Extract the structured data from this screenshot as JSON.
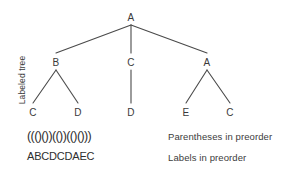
{
  "figure": {
    "side_label": "Labeled tree",
    "background_color": "#ffffff",
    "line_color": "#4a4a4a",
    "text_color": "#3a3a3a"
  },
  "tree": {
    "nodes": [
      {
        "id": "n0",
        "label": "A",
        "x": 131,
        "y": 17,
        "level": 0
      },
      {
        "id": "n1",
        "label": "B",
        "x": 56,
        "y": 62,
        "level": 1
      },
      {
        "id": "n2",
        "label": "C",
        "x": 131,
        "y": 62,
        "level": 1
      },
      {
        "id": "n3",
        "label": "A",
        "x": 207,
        "y": 62,
        "level": 1
      },
      {
        "id": "n4",
        "label": "C",
        "x": 33,
        "y": 112,
        "level": 2
      },
      {
        "id": "n5",
        "label": "D",
        "x": 78,
        "y": 112,
        "level": 2
      },
      {
        "id": "n6",
        "label": "D",
        "x": 131,
        "y": 112,
        "level": 2
      },
      {
        "id": "n7",
        "label": "E",
        "x": 186,
        "y": 112,
        "level": 2
      },
      {
        "id": "n8",
        "label": "C",
        "x": 230,
        "y": 112,
        "level": 2
      }
    ],
    "edges": [
      {
        "from": "n0",
        "to": "n1"
      },
      {
        "from": "n0",
        "to": "n2"
      },
      {
        "from": "n0",
        "to": "n3"
      },
      {
        "from": "n1",
        "to": "n4"
      },
      {
        "from": "n1",
        "to": "n5"
      },
      {
        "from": "n2",
        "to": "n6"
      },
      {
        "from": "n3",
        "to": "n7"
      },
      {
        "from": "n3",
        "to": "n8"
      }
    ]
  },
  "sequences": {
    "parentheses": "((()())(())(()()))",
    "parentheses_caption": "Parentheses in preorder",
    "labels": "ABCDCDAEC",
    "labels_caption": "Labels in preorder"
  }
}
